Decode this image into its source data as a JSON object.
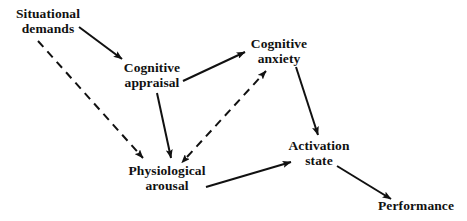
{
  "diagram": {
    "nodes": [
      {
        "id": "situational-demands",
        "label": "Situational\ndemands"
      },
      {
        "id": "cognitive-appraisal",
        "label": "Cognitive\nappraisal"
      },
      {
        "id": "cognitive-anxiety",
        "label": "Cognitive\nanxiety"
      },
      {
        "id": "physiological-arousal",
        "label": "Physiological\narousal"
      },
      {
        "id": "activation-state",
        "label": "Activation\nstate"
      },
      {
        "id": "performance",
        "label": "Performance"
      }
    ],
    "edges": [
      {
        "id": "edge-situational-to-appraisal",
        "from": "situational-demands",
        "to": "cognitive-appraisal",
        "style": "solid",
        "direction": "forward"
      },
      {
        "id": "edge-situational-to-arousal",
        "from": "situational-demands",
        "to": "physiological-arousal",
        "style": "dashed",
        "direction": "forward"
      },
      {
        "id": "edge-appraisal-to-anxiety",
        "from": "cognitive-appraisal",
        "to": "cognitive-anxiety",
        "style": "solid",
        "direction": "forward"
      },
      {
        "id": "edge-appraisal-to-arousal",
        "from": "cognitive-appraisal",
        "to": "physiological-arousal",
        "style": "solid",
        "direction": "forward"
      },
      {
        "id": "edge-anxiety-arousal-bidir",
        "from": "cognitive-anxiety",
        "to": "physiological-arousal",
        "style": "dashed",
        "direction": "both"
      },
      {
        "id": "edge-anxiety-to-activation",
        "from": "cognitive-anxiety",
        "to": "activation-state",
        "style": "solid",
        "direction": "forward"
      },
      {
        "id": "edge-arousal-to-activation",
        "from": "physiological-arousal",
        "to": "activation-state",
        "style": "solid",
        "direction": "forward"
      },
      {
        "id": "edge-activation-to-performance",
        "from": "activation-state",
        "to": "performance",
        "style": "solid",
        "direction": "forward"
      }
    ],
    "colors": {
      "ink": "#111111",
      "background": "#ffffff"
    }
  }
}
